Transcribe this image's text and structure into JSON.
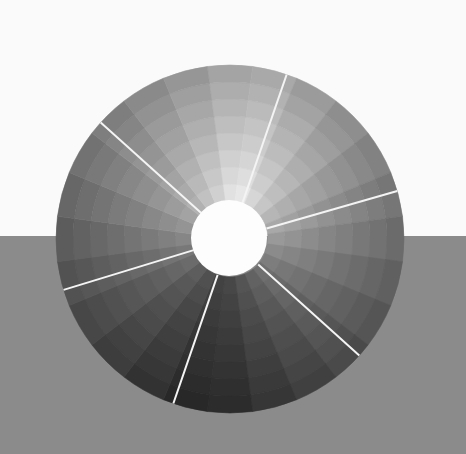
{
  "scene": {
    "background_top_color": "#fafafa",
    "background_bottom_color": "#8b8b8b",
    "horizon_y": 236
  },
  "wheel": {
    "center": [
      230,
      239
    ],
    "outer_radius": 174,
    "inner_radius": 38,
    "hub_color": "#fdfdfd",
    "wedges": 24,
    "rings": 8,
    "brightest_angle_deg": -80,
    "max_gray": 238,
    "min_gray": 62,
    "ring_darkening": 9,
    "divider_color": "#f4f4f4",
    "divider_width": 2,
    "dividers_deg": [
      -71,
      -138,
      -16,
      163,
      109,
      42
    ]
  }
}
